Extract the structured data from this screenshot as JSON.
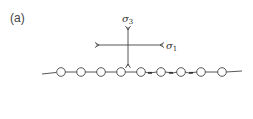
{
  "figure": {
    "panel_label": "(a)",
    "stress_axes": {
      "sigma3_label": "σ",
      "sigma3_sub": "3",
      "sigma1_label": "σ",
      "sigma1_sub": "1"
    },
    "chain": {
      "node_count": 9,
      "node_x": [
        61,
        81,
        101,
        121,
        141,
        161,
        181,
        201,
        222
      ],
      "baseline_y": 72,
      "node_radius": 4.3
    },
    "colors": {
      "line": "#444444",
      "node_fill": "#ffffff",
      "text": "#333333"
    }
  }
}
